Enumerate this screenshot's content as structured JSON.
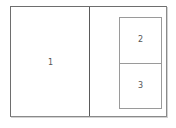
{
  "diagram": {
    "type": "panel-layout",
    "panels": [
      {
        "id": "1",
        "label": "1",
        "position": "left",
        "description": "large left panel"
      },
      {
        "id": "2",
        "label": "2",
        "position": "right-top",
        "description": "upper inset panel on right side"
      },
      {
        "id": "3",
        "label": "3",
        "position": "right-bottom",
        "description": "lower inset panel on right side"
      }
    ],
    "colors": {
      "border": "#6e6e6e",
      "divider": "#5a5a5a",
      "inner_border": "#9a9a9a",
      "label": "#555555",
      "background": "#ffffff"
    }
  }
}
